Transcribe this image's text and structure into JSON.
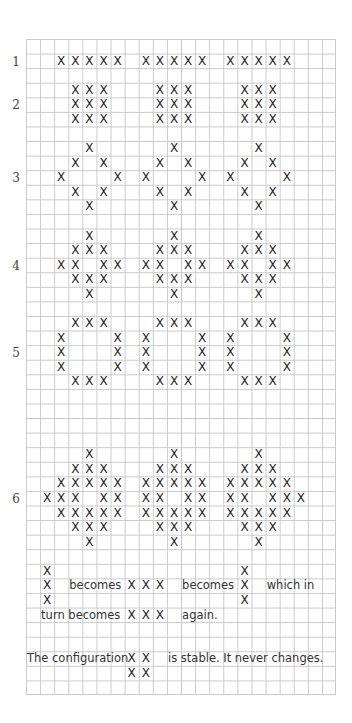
{
  "grid": {
    "cols": 22,
    "rows": 45,
    "cell_w": 14.1,
    "cell_h": 14.58,
    "left": 26,
    "top": 39,
    "line_color": "#c9c9c9",
    "mark_color": "#1e1e1e",
    "mark": "X"
  },
  "labels": [
    {
      "text": "1",
      "row": 1
    },
    {
      "text": "2",
      "row": 4
    },
    {
      "text": "3",
      "row": 9
    },
    {
      "text": "4",
      "row": 15
    },
    {
      "text": "5",
      "row": 21
    },
    {
      "text": "6",
      "row": 31
    }
  ],
  "patterns": [
    {
      "id": 1,
      "marks": [
        [
          1,
          2
        ],
        [
          1,
          3
        ],
        [
          1,
          4
        ],
        [
          1,
          5
        ],
        [
          1,
          6
        ],
        [
          1,
          8
        ],
        [
          1,
          9
        ],
        [
          1,
          10
        ],
        [
          1,
          11
        ],
        [
          1,
          12
        ],
        [
          1,
          14
        ],
        [
          1,
          15
        ],
        [
          1,
          16
        ],
        [
          1,
          17
        ],
        [
          1,
          18
        ]
      ]
    },
    {
      "id": 2,
      "marks": [
        [
          3,
          3
        ],
        [
          3,
          4
        ],
        [
          3,
          5
        ],
        [
          4,
          3
        ],
        [
          4,
          4
        ],
        [
          4,
          5
        ],
        [
          5,
          3
        ],
        [
          5,
          4
        ],
        [
          5,
          5
        ],
        [
          3,
          9
        ],
        [
          3,
          10
        ],
        [
          3,
          11
        ],
        [
          4,
          9
        ],
        [
          4,
          10
        ],
        [
          4,
          11
        ],
        [
          5,
          9
        ],
        [
          5,
          10
        ],
        [
          5,
          11
        ],
        [
          3,
          15
        ],
        [
          3,
          16
        ],
        [
          3,
          17
        ],
        [
          4,
          15
        ],
        [
          4,
          16
        ],
        [
          4,
          17
        ],
        [
          5,
          15
        ],
        [
          5,
          16
        ],
        [
          5,
          17
        ]
      ]
    },
    {
      "id": 3,
      "marks": [
        [
          7,
          4
        ],
        [
          8,
          3
        ],
        [
          8,
          5
        ],
        [
          9,
          2
        ],
        [
          9,
          6
        ],
        [
          10,
          3
        ],
        [
          10,
          5
        ],
        [
          11,
          4
        ],
        [
          7,
          10
        ],
        [
          8,
          9
        ],
        [
          8,
          11
        ],
        [
          9,
          8
        ],
        [
          9,
          12
        ],
        [
          10,
          9
        ],
        [
          10,
          11
        ],
        [
          11,
          10
        ],
        [
          7,
          16
        ],
        [
          8,
          15
        ],
        [
          8,
          17
        ],
        [
          9,
          14
        ],
        [
          9,
          18
        ],
        [
          10,
          15
        ],
        [
          10,
          17
        ],
        [
          11,
          16
        ]
      ]
    },
    {
      "id": 4,
      "marks": [
        [
          13,
          4
        ],
        [
          14,
          3
        ],
        [
          14,
          4
        ],
        [
          14,
          5
        ],
        [
          15,
          2
        ],
        [
          15,
          3
        ],
        [
          15,
          5
        ],
        [
          15,
          6
        ],
        [
          16,
          3
        ],
        [
          16,
          4
        ],
        [
          16,
          5
        ],
        [
          17,
          4
        ],
        [
          13,
          10
        ],
        [
          14,
          9
        ],
        [
          14,
          10
        ],
        [
          14,
          11
        ],
        [
          15,
          8
        ],
        [
          15,
          9
        ],
        [
          15,
          11
        ],
        [
          15,
          12
        ],
        [
          16,
          9
        ],
        [
          16,
          10
        ],
        [
          16,
          11
        ],
        [
          17,
          10
        ],
        [
          13,
          16
        ],
        [
          14,
          15
        ],
        [
          14,
          16
        ],
        [
          14,
          17
        ],
        [
          15,
          14
        ],
        [
          15,
          15
        ],
        [
          15,
          17
        ],
        [
          15,
          18
        ],
        [
          16,
          15
        ],
        [
          16,
          16
        ],
        [
          16,
          17
        ],
        [
          17,
          16
        ]
      ]
    },
    {
      "id": 5,
      "marks": [
        [
          19,
          3
        ],
        [
          19,
          4
        ],
        [
          19,
          5
        ],
        [
          20,
          2
        ],
        [
          20,
          6
        ],
        [
          21,
          2
        ],
        [
          21,
          6
        ],
        [
          22,
          2
        ],
        [
          22,
          6
        ],
        [
          23,
          3
        ],
        [
          23,
          4
        ],
        [
          23,
          5
        ],
        [
          19,
          9
        ],
        [
          19,
          10
        ],
        [
          19,
          11
        ],
        [
          20,
          8
        ],
        [
          20,
          12
        ],
        [
          21,
          8
        ],
        [
          21,
          12
        ],
        [
          22,
          8
        ],
        [
          22,
          12
        ],
        [
          23,
          9
        ],
        [
          23,
          10
        ],
        [
          23,
          11
        ],
        [
          19,
          15
        ],
        [
          19,
          16
        ],
        [
          19,
          17
        ],
        [
          20,
          14
        ],
        [
          20,
          18
        ],
        [
          21,
          14
        ],
        [
          21,
          18
        ],
        [
          22,
          14
        ],
        [
          22,
          18
        ],
        [
          23,
          15
        ],
        [
          23,
          16
        ],
        [
          23,
          17
        ]
      ]
    },
    {
      "id": 6,
      "marks": [
        [
          28,
          4
        ],
        [
          29,
          3
        ],
        [
          29,
          4
        ],
        [
          29,
          5
        ],
        [
          30,
          2
        ],
        [
          30,
          3
        ],
        [
          30,
          4
        ],
        [
          30,
          5
        ],
        [
          30,
          6
        ],
        [
          31,
          1
        ],
        [
          31,
          2
        ],
        [
          31,
          3
        ],
        [
          31,
          5
        ],
        [
          31,
          6
        ],
        [
          32,
          2
        ],
        [
          32,
          3
        ],
        [
          32,
          4
        ],
        [
          32,
          5
        ],
        [
          32,
          6
        ],
        [
          33,
          3
        ],
        [
          33,
          4
        ],
        [
          33,
          5
        ],
        [
          34,
          4
        ],
        [
          28,
          10
        ],
        [
          29,
          9
        ],
        [
          29,
          10
        ],
        [
          29,
          11
        ],
        [
          30,
          8
        ],
        [
          30,
          9
        ],
        [
          30,
          10
        ],
        [
          30,
          11
        ],
        [
          30,
          12
        ],
        [
          31,
          8
        ],
        [
          31,
          9
        ],
        [
          31,
          11
        ],
        [
          31,
          12
        ],
        [
          32,
          8
        ],
        [
          32,
          9
        ],
        [
          32,
          10
        ],
        [
          32,
          11
        ],
        [
          32,
          12
        ],
        [
          33,
          9
        ],
        [
          33,
          10
        ],
        [
          33,
          11
        ],
        [
          34,
          10
        ],
        [
          28,
          16
        ],
        [
          29,
          15
        ],
        [
          29,
          16
        ],
        [
          29,
          17
        ],
        [
          30,
          14
        ],
        [
          30,
          15
        ],
        [
          30,
          16
        ],
        [
          30,
          17
        ],
        [
          30,
          18
        ],
        [
          31,
          14
        ],
        [
          31,
          15
        ],
        [
          31,
          17
        ],
        [
          31,
          18
        ],
        [
          31,
          19
        ],
        [
          32,
          14
        ],
        [
          32,
          15
        ],
        [
          32,
          16
        ],
        [
          32,
          17
        ],
        [
          32,
          18
        ],
        [
          33,
          15
        ],
        [
          33,
          16
        ],
        [
          33,
          17
        ],
        [
          34,
          16
        ]
      ]
    }
  ],
  "explanation": {
    "marks": [
      [
        36,
        1
      ],
      [
        37,
        1
      ],
      [
        38,
        1
      ],
      [
        37,
        7
      ],
      [
        37,
        8
      ],
      [
        37,
        9
      ],
      [
        36,
        15
      ],
      [
        37,
        15
      ],
      [
        38,
        15
      ],
      [
        39,
        7
      ],
      [
        39,
        8
      ],
      [
        39,
        9
      ],
      [
        42,
        7
      ],
      [
        42,
        8
      ],
      [
        43,
        7
      ],
      [
        43,
        8
      ]
    ],
    "texts": [
      {
        "text": "becomes",
        "row": 37,
        "col": 3
      },
      {
        "text": "becomes",
        "row": 37,
        "col": 11
      },
      {
        "text": "which in",
        "row": 37,
        "col": 17
      },
      {
        "text": "turn becomes",
        "row": 39,
        "col": 1
      },
      {
        "text": "again.",
        "row": 39,
        "col": 11
      },
      {
        "text": "The configuration",
        "row": 42,
        "col": 0
      },
      {
        "text": "is stable. It never changes.",
        "row": 42,
        "col": 10
      }
    ]
  }
}
